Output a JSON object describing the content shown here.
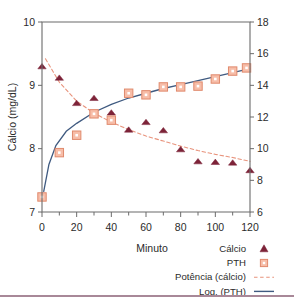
{
  "axes": {
    "x": {
      "title": "Minuto",
      "ticks": [
        "0",
        "20",
        "40",
        "60",
        "80",
        "100",
        "120"
      ],
      "min": 0,
      "max": 120,
      "minor_step": 10
    },
    "y_left": {
      "title": "Cálcio (mg/dL)",
      "ticks": [
        "7",
        "8",
        "9",
        "10"
      ],
      "min": 7,
      "max": 10
    },
    "y_right": {
      "title": "",
      "ticks": [
        "6",
        "8",
        "10",
        "12",
        "14",
        "16",
        "18"
      ],
      "min": 6,
      "max": 18
    }
  },
  "legend": {
    "items": [
      {
        "label": "Cálcio",
        "marker": "triangle-marker",
        "color": "#7d2338"
      },
      {
        "label": "PTH",
        "marker": "square-marker",
        "color": "#f0a089"
      },
      {
        "label": "Potência (cálcio)",
        "marker": "dashed-line",
        "color": "#e8937c"
      },
      {
        "label": "Log. (PTH)",
        "marker": "solid-line",
        "color": "#3f5a80"
      }
    ]
  },
  "colors": {
    "calcium_marker": "#7d2338",
    "pth_marker_fill": "#f7bda8",
    "pth_marker_stroke": "#e08a6d",
    "power_trend": "#e8937c",
    "log_trend": "#3f5a80",
    "axis": "#6b6b6b",
    "bottom_rule": "#a88898"
  },
  "chart_data": {
    "type": "scatter",
    "title": "",
    "xlabel": "Minuto",
    "ylabel": "Cálcio (mg/dL)",
    "y2label": "",
    "xlim": [
      0,
      120
    ],
    "ylim": [
      7,
      10
    ],
    "y2lim": [
      6,
      18
    ],
    "grid": false,
    "legend_position": "bottom-right",
    "series": [
      {
        "name": "Cálcio",
        "type": "scatter",
        "axis": "left",
        "marker": "triangle",
        "color": "#7d2338",
        "x": [
          0,
          10,
          20,
          30,
          40,
          50,
          60,
          70,
          80,
          90,
          100,
          110,
          120
        ],
        "values": [
          9.3,
          9.12,
          8.72,
          8.8,
          8.57,
          8.3,
          8.42,
          8.29,
          7.99,
          7.8,
          7.79,
          7.78,
          7.66
        ]
      },
      {
        "name": "PTH",
        "type": "scatter",
        "axis": "right",
        "marker": "square",
        "color": "#f7bda8",
        "x": [
          0,
          10,
          20,
          30,
          40,
          50,
          60,
          70,
          80,
          90,
          100,
          110,
          118
        ],
        "values": [
          6.95,
          9.75,
          10.85,
          12.2,
          11.8,
          13.5,
          13.4,
          13.9,
          13.9,
          13.95,
          14.4,
          14.9,
          15.1
        ]
      },
      {
        "name": "Potência (cálcio)",
        "type": "line",
        "style": "dashed",
        "axis": "left",
        "color": "#e8937c",
        "x": [
          2,
          10,
          20,
          30,
          40,
          50,
          60,
          70,
          80,
          90,
          100,
          110,
          120
        ],
        "values": [
          9.42,
          9.05,
          8.75,
          8.56,
          8.42,
          8.3,
          8.2,
          8.12,
          8.04,
          7.97,
          7.91,
          7.86,
          7.8
        ]
      },
      {
        "name": "Log. (PTH)",
        "type": "line",
        "style": "solid",
        "axis": "right",
        "color": "#3f5a80",
        "x": [
          1,
          4,
          8,
          14,
          20,
          30,
          40,
          50,
          60,
          70,
          80,
          90,
          100,
          110,
          120
        ],
        "values": [
          7.3,
          9.0,
          10.2,
          11.1,
          11.6,
          12.3,
          12.8,
          13.2,
          13.5,
          13.8,
          14.05,
          14.3,
          14.55,
          14.8,
          15.05
        ]
      }
    ]
  }
}
